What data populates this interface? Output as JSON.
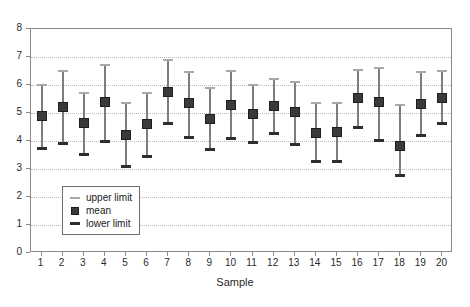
{
  "chart_data": {
    "type": "scatter",
    "title": "",
    "xlabel": "Sample",
    "ylabel": "",
    "xlim": [
      0.5,
      20.5
    ],
    "ylim": [
      0,
      8
    ],
    "ytick_step": 1,
    "grid": true,
    "legend_position": "inside-bottom-left",
    "categories": [
      1,
      2,
      3,
      4,
      5,
      6,
      7,
      8,
      9,
      10,
      11,
      12,
      13,
      14,
      15,
      16,
      17,
      18,
      19,
      20
    ],
    "xtick_labels": [
      "1",
      "2",
      "3",
      "4",
      "5",
      "6",
      "7",
      "8",
      "9",
      "10",
      "11",
      "12",
      "13",
      "14",
      "15",
      "16",
      "17",
      "18",
      "19",
      "20"
    ],
    "ytick_labels": [
      "0",
      "1",
      "2",
      "3",
      "4",
      "5",
      "6",
      "7",
      "8"
    ],
    "series": [
      {
        "name": "upper limit",
        "marker": "thin-cap",
        "color": "#a9a9a9",
        "values": [
          6.0,
          6.5,
          5.7,
          6.7,
          5.35,
          5.7,
          6.9,
          6.45,
          5.9,
          6.5,
          6.0,
          6.2,
          6.1,
          5.35,
          5.35,
          6.55,
          6.6,
          5.3,
          6.45,
          6.5
        ]
      },
      {
        "name": "mean",
        "marker": "square",
        "color": "#3a3a3a",
        "values": [
          4.88,
          5.23,
          4.63,
          5.38,
          4.2,
          4.6,
          5.75,
          5.35,
          4.8,
          5.3,
          4.98,
          5.25,
          5.05,
          4.3,
          4.33,
          5.55,
          5.4,
          3.83,
          5.33,
          5.55
        ]
      },
      {
        "name": "lower limit",
        "marker": "thick-cap",
        "color": "#2e2e2e",
        "values": [
          3.75,
          3.92,
          3.55,
          4.0,
          3.1,
          3.45,
          4.65,
          4.15,
          3.7,
          4.1,
          3.95,
          4.3,
          3.9,
          3.3,
          3.3,
          4.5,
          4.05,
          2.8,
          4.2,
          4.65
        ]
      }
    ]
  },
  "legend": {
    "items": [
      {
        "label": "upper limit",
        "key": "upper-limit-key"
      },
      {
        "label": "mean",
        "key": "mean-key"
      },
      {
        "label": "lower limit",
        "key": "lower-limit-key"
      }
    ]
  }
}
